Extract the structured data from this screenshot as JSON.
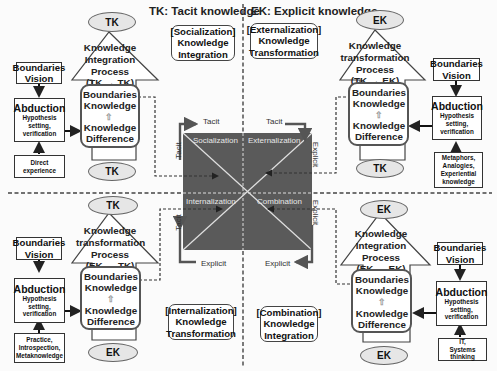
{
  "legend": {
    "tk": "TK: Tacit knowledge",
    "ek": "EK: Explicit knowledge"
  },
  "colors": {
    "square": "#5a5a5a",
    "arrow": "#555555",
    "ellipse_fill": "#e6e6e6",
    "quadrant_text": "#e8e8e8"
  },
  "center": {
    "quadrants": {
      "socialization": "Socialization",
      "externalization": "Externalization",
      "internalization": "Internalization",
      "combination": "Combination"
    },
    "axes": {
      "tl_top": "Tacit",
      "tl_side": "Tacit",
      "tr_top": "Tacit",
      "tr_side": "Explicit",
      "bl_side": "Tacit",
      "bl_bottom": "Explicit",
      "br_side": "Explicit",
      "br_bottom": "Explicit"
    }
  },
  "modes": {
    "socialization": [
      "[Socialization]",
      "Knowledge",
      "Integration"
    ],
    "externalization": [
      "[Externalization]",
      "Knowledge",
      "Transformation"
    ],
    "internalization": [
      "[Internalization]",
      "Knowledge",
      "Transformation"
    ],
    "combination": [
      "[Combination]",
      "Knowledge",
      "Integration"
    ]
  },
  "quadrants": {
    "top_left": {
      "top_ellipse": "TK",
      "bottom_ellipse": "TK",
      "process": [
        "Knowledge",
        "Integration",
        "Process",
        "(TK → TK)"
      ],
      "inner_top": [
        "Boundaries",
        "Knowledge"
      ],
      "inner_bottom": [
        "Knowledge",
        "Difference"
      ],
      "vision": [
        "Boundaries",
        "Vision"
      ],
      "abduction_title": "Abduction",
      "abduction_sub": [
        "Hypothesis",
        "setting,",
        "verification"
      ],
      "source": [
        "Direct experience"
      ]
    },
    "top_right": {
      "top_ellipse": "EK",
      "bottom_ellipse": "TK",
      "process": [
        "Knowledge",
        "transformation",
        "Process",
        "(TK → EK)"
      ],
      "inner_top": [
        "Boundaries",
        "Knowledge"
      ],
      "inner_bottom": [
        "Knowledge",
        "Difference"
      ],
      "vision": [
        "Boundaries",
        "Vision"
      ],
      "abduction_title": "Abduction",
      "abduction_sub": [
        "Hypothesis",
        "setting,",
        "verification"
      ],
      "source": [
        "Metaphors,",
        "Analogies,",
        "Experiential",
        "knowledge"
      ]
    },
    "bottom_left": {
      "top_ellipse": "TK",
      "bottom_ellipse": "EK",
      "process": [
        "Knowledge",
        "transformation",
        "Process",
        "(EK → TK)"
      ],
      "inner_top": [
        "Boundaries",
        "Knowledge"
      ],
      "inner_bottom": [
        "Knowledge",
        "Difference"
      ],
      "vision": [
        "Boundaries",
        "Vision"
      ],
      "abduction_title": "Abduction",
      "abduction_sub": [
        "Hypothesis",
        "setting,",
        "verification"
      ],
      "source": [
        "Practice,",
        "Introspection,",
        "Metaknowledge"
      ]
    },
    "bottom_right": {
      "top_ellipse": "EK",
      "bottom_ellipse": "EK",
      "process": [
        "Knowledge",
        "Integration",
        "Process",
        "(EK → EK)"
      ],
      "inner_top": [
        "Boundaries",
        "Knowledge"
      ],
      "inner_bottom": [
        "Knowledge",
        "Difference"
      ],
      "vision": [
        "Boundaries",
        "Vision"
      ],
      "abduction_title": "Abduction",
      "abduction_sub": [
        "Hypothesis",
        "setting,",
        "verification"
      ],
      "source": [
        "IT,",
        "Systems thinking"
      ]
    }
  }
}
